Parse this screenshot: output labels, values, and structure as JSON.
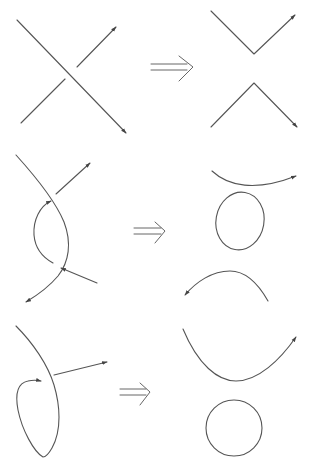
{
  "diagram": {
    "type": "knot-smoothing-moves",
    "colors": {
      "stroke": "#555555",
      "arrow": "#444444",
      "background": "#ffffff"
    },
    "rows": [
      {
        "name": "simple-crossing",
        "before": "oriented-crossing",
        "relation": "implies",
        "after": [
          "v-arc-top",
          "lambda-arc-bottom"
        ]
      },
      {
        "name": "bigon-twist",
        "before": "two-strands-with-two-crossings",
        "relation": "implies",
        "after": [
          "upper-arc",
          "closed-loop",
          "lower-arc"
        ]
      },
      {
        "name": "kink",
        "before": "strand-with-curl",
        "relation": "implies",
        "after": [
          "u-arc",
          "circle"
        ]
      }
    ],
    "implies_symbol": "⟹"
  }
}
